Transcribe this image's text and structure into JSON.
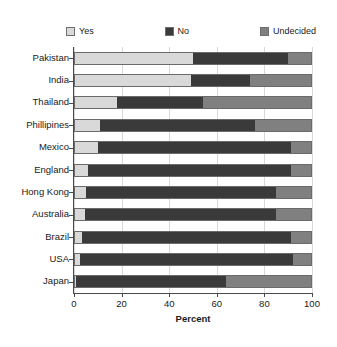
{
  "chart_data": {
    "type": "bar",
    "orientation": "horizontal",
    "stacked": true,
    "title": "",
    "xlabel": "Percent",
    "ylabel": "",
    "xlim": [
      0,
      100
    ],
    "xticks": [
      0,
      20,
      40,
      60,
      80,
      100
    ],
    "xticklabels": [
      "0",
      "20",
      "40",
      "60",
      "80",
      "100"
    ],
    "grid": true,
    "legend_position": "top",
    "categories": [
      "Pakistan",
      "India",
      "Thailand",
      "Phillipines",
      "Mexico",
      "England",
      "Hong Kong",
      "Australia",
      "Brazil",
      "USA",
      "Japan"
    ],
    "series": [
      {
        "name": "Yes",
        "color": "#d9d9d9",
        "values": [
          50,
          49,
          18,
          11,
          10,
          6,
          5,
          4.5,
          3.5,
          2.5,
          1
        ]
      },
      {
        "name": "No",
        "color": "#3a3a3a",
        "values": [
          40,
          25,
          36,
          65,
          81,
          85,
          80,
          80.5,
          87.5,
          89.5,
          63
        ]
      },
      {
        "name": "Undecided",
        "color": "#808080",
        "values": [
          10,
          26,
          46,
          24,
          9,
          9,
          15,
          15,
          9,
          8,
          36
        ]
      }
    ]
  },
  "legend": {
    "items": [
      {
        "label": "Yes",
        "color": "#d9d9d9"
      },
      {
        "label": "No",
        "color": "#3a3a3a"
      },
      {
        "label": "Undecided",
        "color": "#808080"
      }
    ]
  },
  "axis": {
    "x_title": "Percent",
    "x_tick_labels": [
      "0",
      "20",
      "40",
      "60",
      "80",
      "100"
    ]
  }
}
